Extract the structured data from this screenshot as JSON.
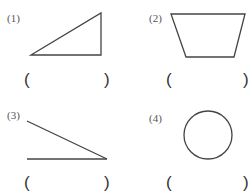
{
  "problems": [
    {
      "label": "(1)",
      "shape": "right-triangle",
      "answer_open": "(",
      "answer_close": ")"
    },
    {
      "label": "(2)",
      "shape": "trapezoid",
      "answer_open": "(",
      "answer_close": ")"
    },
    {
      "label": "(3)",
      "shape": "angle",
      "answer_open": "(",
      "answer_close": ")"
    },
    {
      "label": "(4)",
      "shape": "circle",
      "answer_open": "(",
      "answer_close": ")"
    }
  ]
}
